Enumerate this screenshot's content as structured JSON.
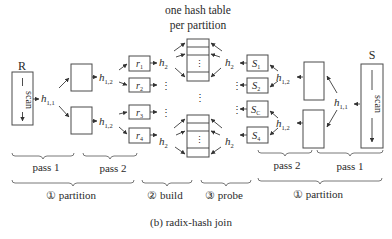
{
  "diagram": {
    "caption": "(b) radix-hash join",
    "header": {
      "line1": "one hash table",
      "line2": "per partition"
    },
    "relations": {
      "left": {
        "name": "R",
        "scan_label": "scan"
      },
      "right": {
        "name": "S",
        "scan_label": "scan"
      }
    },
    "hash_functions": {
      "h11": {
        "base": "h",
        "sub": "1,1"
      },
      "h12": {
        "base": "h",
        "sub": "1,2"
      },
      "h2": {
        "base": "h",
        "sub": "2"
      }
    },
    "left_partitions": [
      {
        "base": "r",
        "sub": "1"
      },
      {
        "base": "r",
        "sub": "2"
      },
      {
        "base": "r",
        "sub": "3"
      },
      {
        "base": "r",
        "sub": "4"
      }
    ],
    "right_partitions": [
      {
        "base": "S",
        "sub": "1"
      },
      {
        "base": "S",
        "sub": "2"
      },
      {
        "base": "S",
        "sub": "C"
      },
      {
        "base": "S",
        "sub": "4"
      }
    ],
    "ellipsis": "⋮",
    "passes": {
      "left": [
        "pass 1",
        "pass 2"
      ],
      "right": [
        "pass 2",
        "pass 1"
      ]
    },
    "phases": {
      "partition_left": "① partition",
      "build": "② build",
      "probe": "③ probe",
      "partition_right": "① partition"
    }
  }
}
